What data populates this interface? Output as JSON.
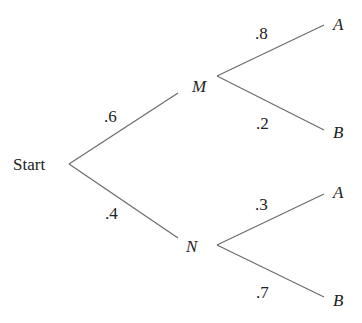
{
  "diagram": {
    "type": "probability-tree",
    "root": "Start",
    "level1": [
      {
        "node": "M",
        "prob": ".6"
      },
      {
        "node": "N",
        "prob": ".4"
      }
    ],
    "level2": {
      "M": [
        {
          "node": "A",
          "prob": ".8"
        },
        {
          "node": "B",
          "prob": ".2"
        }
      ],
      "N": [
        {
          "node": "A",
          "prob": ".3"
        },
        {
          "node": "B",
          "prob": ".7"
        }
      ]
    }
  },
  "colors": {
    "line": "#6e6e6e",
    "text": "#222222"
  }
}
